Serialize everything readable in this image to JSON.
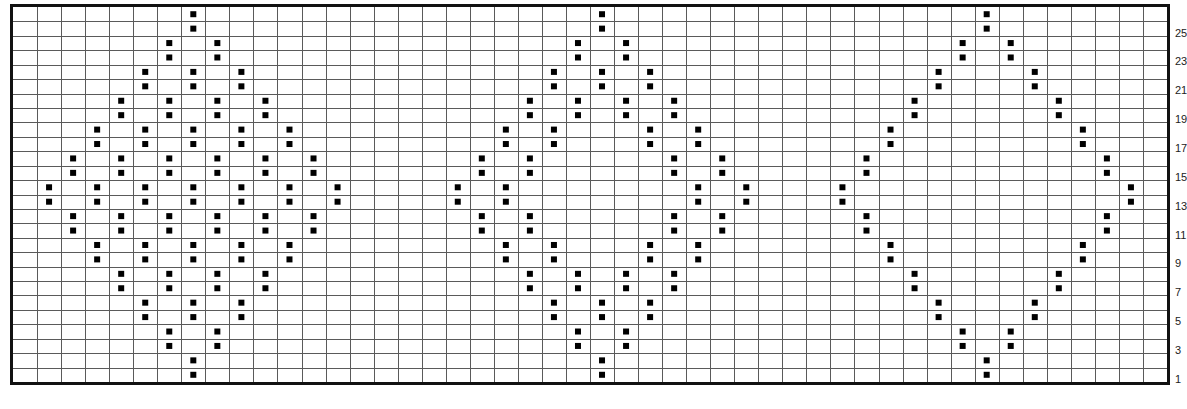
{
  "chart_data": {
    "type": "table",
    "title": "",
    "grid": {
      "columns": 48,
      "rows": 26,
      "row_numbering": "bottom-to-top"
    },
    "row_labels": [
      "25",
      "23",
      "21",
      "19",
      "17",
      "15",
      "13",
      "11",
      "9",
      "7",
      "5",
      "3",
      "1"
    ],
    "colors": {
      "grid_line": "#5a5a5a",
      "border": "#111111",
      "marker": "#000000",
      "background": "#ffffff"
    },
    "motifs": [
      {
        "name": "filled-checker-diamond",
        "center_col": 7,
        "half_width": 6,
        "style": "filled"
      },
      {
        "name": "double-outline-diamond",
        "center_col": 24,
        "half_width": 6,
        "style": "double-outline"
      },
      {
        "name": "single-outline-diamond",
        "center_col": 40,
        "half_width": 6,
        "style": "outline"
      }
    ]
  }
}
